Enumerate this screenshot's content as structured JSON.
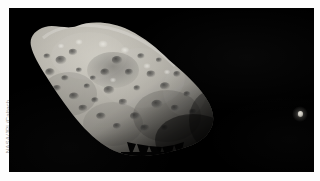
{
  "image": {
    "alt_title": "Asteroid 243 Ida with its moon Dactyl",
    "credit": "NASA/JPL/Caltech",
    "background_color": "#000000",
    "page_background_color": "#fdfdfd",
    "body_color": "#b9b6ad",
    "shadow_color": "#0a0a0a"
  },
  "objects": {
    "asteroid": {
      "name": "243 Ida",
      "label": "Ida"
    },
    "moon": {
      "name": "Dactyl",
      "label": "Dactyl"
    }
  }
}
